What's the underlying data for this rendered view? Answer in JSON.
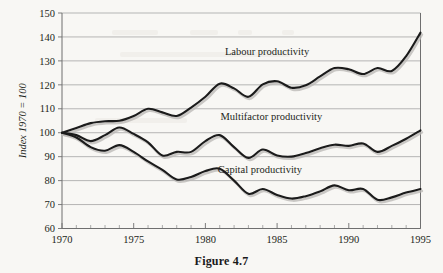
{
  "caption": "Figure 4.7",
  "chart_data": {
    "type": "line",
    "title": "",
    "subtitle": "",
    "xlabel": "",
    "ylabel": "Index 1970 = 100",
    "xlim": [
      1970,
      1995
    ],
    "ylim": [
      60,
      150
    ],
    "grid": true,
    "legend_position": "inline-labels",
    "x_tick_labels": [
      "1970",
      "1975",
      "1980",
      "1985",
      "1990",
      "1995"
    ],
    "x_tick_values": [
      1970,
      1975,
      1980,
      1985,
      1990,
      1995
    ],
    "x_minor_ticks": [
      1971,
      1972,
      1973,
      1974,
      1976,
      1977,
      1978,
      1979,
      1981,
      1982,
      1983,
      1984,
      1986,
      1987,
      1988,
      1989,
      1991,
      1992,
      1993,
      1994
    ],
    "y_tick_labels": [
      "60",
      "70",
      "80",
      "90",
      "100",
      "110",
      "120",
      "130",
      "140",
      "150"
    ],
    "y_tick_values": [
      60,
      70,
      80,
      90,
      100,
      110,
      120,
      130,
      140,
      150
    ],
    "x": [
      1970,
      1971,
      1972,
      1973,
      1974,
      1975,
      1976,
      1977,
      1978,
      1979,
      1980,
      1981,
      1982,
      1983,
      1984,
      1985,
      1986,
      1987,
      1988,
      1989,
      1990,
      1991,
      1992,
      1993,
      1994,
      1995
    ],
    "series": [
      {
        "name": "Labour productivity",
        "color": "#1b1b1b",
        "label_x": 1984.3,
        "label_y": 132.5,
        "values": [
          100.0,
          102.0,
          104.0,
          104.8,
          105.0,
          107.0,
          110.0,
          108.5,
          107.0,
          110.5,
          115.0,
          120.5,
          118.5,
          115.0,
          120.2,
          121.5,
          118.8,
          119.8,
          123.5,
          127.0,
          126.5,
          124.5,
          127.0,
          125.8,
          132.0,
          141.8
        ]
      },
      {
        "name": "Multifactor productivity",
        "color": "#1b1b1b",
        "label_x": 1984.6,
        "label_y": 105.5,
        "values": [
          100.0,
          99.0,
          96.5,
          99.0,
          102.2,
          99.5,
          96.0,
          90.5,
          92.0,
          92.0,
          96.5,
          99.0,
          94.0,
          89.5,
          93.0,
          90.5,
          90.0,
          91.5,
          93.5,
          95.0,
          94.5,
          95.5,
          92.0,
          94.5,
          97.5,
          101.0
        ]
      },
      {
        "name": "Capital productivity",
        "color": "#1b1b1b",
        "label_x": 1983.8,
        "label_y": 83.0,
        "values": [
          100.0,
          98.0,
          94.0,
          92.5,
          94.8,
          92.0,
          88.0,
          84.5,
          80.5,
          81.5,
          84.0,
          85.0,
          80.0,
          74.5,
          76.5,
          74.0,
          72.5,
          73.5,
          75.5,
          78.0,
          76.0,
          76.5,
          72.0,
          73.0,
          75.0,
          76.5
        ]
      }
    ]
  }
}
